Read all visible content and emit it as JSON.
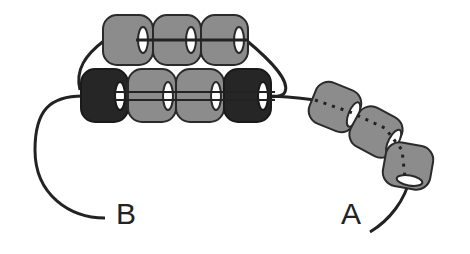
{
  "diagram": {
    "title": "",
    "colors": {
      "thread": "#222222",
      "bead_gray": "#8c8c8c",
      "bead_dark": "#262626",
      "outline": "#2a2a2a",
      "hole": "#ffffff"
    },
    "labels": {
      "thread_end_a": "A",
      "thread_end_b": "B"
    },
    "beads": {
      "top_row": [
        {
          "color": "gray",
          "x": 103,
          "y": 15,
          "w": 50,
          "h": 50
        },
        {
          "color": "gray",
          "x": 153,
          "y": 15,
          "w": 48,
          "h": 50
        },
        {
          "color": "gray",
          "x": 201,
          "y": 15,
          "w": 47,
          "h": 50
        }
      ],
      "bottom_row": [
        {
          "color": "dark",
          "x": 81,
          "y": 69,
          "w": 47,
          "h": 53
        },
        {
          "color": "gray",
          "x": 128,
          "y": 69,
          "w": 48,
          "h": 53
        },
        {
          "color": "gray",
          "x": 176,
          "y": 69,
          "w": 48,
          "h": 53
        },
        {
          "color": "dark",
          "x": 224,
          "y": 69,
          "w": 47,
          "h": 53
        }
      ],
      "strand_a": [
        {
          "color": "gray",
          "cx": 335,
          "cy": 105,
          "rotate": 20
        },
        {
          "color": "gray",
          "cx": 377,
          "cy": 129,
          "rotate": 25
        },
        {
          "color": "gray",
          "cx": 407,
          "cy": 170,
          "rotate": 15
        }
      ]
    }
  }
}
